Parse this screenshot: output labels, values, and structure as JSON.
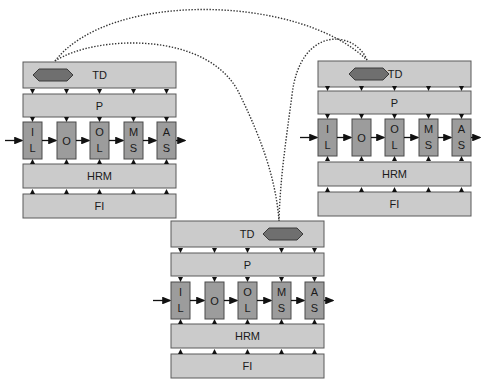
{
  "diagram": {
    "colors": {
      "bar_fill": "#cbcbcb",
      "stage_fill": "#9c9c9c",
      "token_fill": "#6f6f6f",
      "link_color": "#333333"
    },
    "nodes": [
      {
        "id": "left",
        "x": 23,
        "tdY": 62,
        "pY": 94,
        "sY": 122,
        "hY": 164,
        "fY": 194,
        "token_side": "left",
        "layers": {
          "td": "TD",
          "p": "P",
          "hrm": "HRM",
          "fi": "FI"
        },
        "stages": [
          {
            "top": "I",
            "bottom": "L"
          },
          {
            "top": "",
            "bottom": "O",
            "single": "O"
          },
          {
            "top": "O",
            "bottom": "L"
          },
          {
            "top": "M",
            "bottom": "S"
          },
          {
            "top": "A",
            "bottom": "S"
          }
        ]
      },
      {
        "id": "right",
        "x": 318,
        "tdY": 61,
        "pY": 91,
        "sY": 119,
        "hY": 162,
        "fY": 192,
        "token_side": "left-adjacent",
        "layers": {
          "td": "TD",
          "p": "P",
          "hrm": "HRM",
          "fi": "FI"
        },
        "stages": [
          {
            "top": "I",
            "bottom": "L"
          },
          {
            "single": "O"
          },
          {
            "top": "O",
            "bottom": "L"
          },
          {
            "top": "M",
            "bottom": "S"
          },
          {
            "top": "A",
            "bottom": "S"
          }
        ]
      },
      {
        "id": "bottom",
        "x": 171,
        "tdY": 221,
        "pY": 253,
        "sY": 282,
        "hY": 324,
        "fY": 354,
        "token_side": "right",
        "layers": {
          "td": "TD",
          "p": "P",
          "hrm": "HRM",
          "fi": "FI"
        },
        "stages": [
          {
            "top": "I",
            "bottom": "L"
          },
          {
            "single": "O"
          },
          {
            "top": "O",
            "bottom": "L"
          },
          {
            "top": "M",
            "bottom": "S"
          },
          {
            "top": "A",
            "bottom": "S"
          }
        ]
      }
    ],
    "links": [
      {
        "from": "left",
        "to": "right",
        "path": "M55,61 C110,-10 300,-5 367,60"
      },
      {
        "from": "left",
        "to": "bottom",
        "path": "M55,61 C95,35 210,30 240,95 C262,140 276,180 279,221"
      },
      {
        "from": "right",
        "to": "bottom",
        "path": "M367,60 C355,30 300,25 292,95 C286,140 280,180 279,221"
      }
    ]
  }
}
